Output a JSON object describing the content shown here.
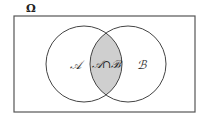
{
  "diagram": {
    "type": "venn",
    "universe_label": "Ω",
    "sets": [
      {
        "name": "set-a",
        "label": "𝒜"
      },
      {
        "name": "set-b",
        "label": "ℬ"
      }
    ],
    "intersection_label": "𝒜∩ℬ",
    "colors": {
      "stroke": "#444444",
      "intersection_fill": "#cfcfcf",
      "background": "#ffffff"
    }
  }
}
